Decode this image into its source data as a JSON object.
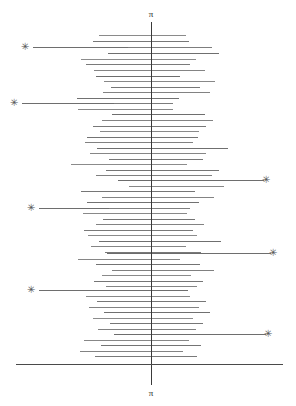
{
  "figure": {
    "width": 296,
    "height": 406,
    "background": "#ffffff"
  },
  "axes": {
    "vertical": {
      "name": "pi-axis",
      "x": 151,
      "y_top": 22,
      "y_bottom": 385,
      "color": "#3a3a3a",
      "top_label": "π",
      "bottom_label": "π"
    },
    "horizontal": {
      "name": "baseline",
      "y": 364,
      "x_start": 16,
      "x_end": 283,
      "color": "#4a4a4a"
    }
  },
  "style": {
    "bar_color": "#808080",
    "lead_line_color": "#6e6e6e",
    "marker_color": "#555555",
    "marker_glyph": "✳"
  },
  "chart_data": {
    "type": "bar",
    "title": "",
    "subtitle": "",
    "xlabel": "",
    "ylabel": "",
    "orientation": "horizontal",
    "center_x": 151,
    "axis_tick_labels": [
      "π",
      "π"
    ],
    "grid": false,
    "legend": null,
    "xlim": [
      0,
      296
    ],
    "ylim": [
      22,
      385
    ],
    "categories": [
      "r1",
      "r2",
      "r3",
      "r4",
      "r5",
      "r6",
      "r7",
      "r8",
      "r9",
      "r10",
      "r11",
      "r12",
      "r13",
      "r14",
      "r15",
      "r16",
      "r17",
      "r18",
      "r19",
      "r20",
      "r21",
      "r22",
      "r23",
      "r24",
      "r25",
      "r26",
      "r27",
      "r28",
      "r29",
      "r30",
      "r31",
      "r32",
      "r33",
      "r34",
      "r35",
      "r36",
      "r37",
      "r38",
      "r39",
      "r40",
      "r41",
      "r42",
      "r43",
      "r44",
      "r45",
      "r46",
      "r47",
      "r48",
      "r49",
      "r50",
      "r51",
      "r52",
      "r53",
      "r54",
      "r55",
      "r56",
      "r57",
      "r58",
      "r59",
      "r60",
      "r61",
      "r62",
      "r63",
      "r64",
      "r65",
      "r66",
      "r67",
      "r68",
      "r69",
      "r70",
      "r71",
      "r72",
      "r73",
      "r74",
      "r75",
      "r76",
      "r77",
      "r78",
      "r79",
      "r80",
      "r81",
      "r82",
      "r83",
      "r84",
      "r85",
      "r86"
    ],
    "bars": [
      {
        "y": 35,
        "x0": 99,
        "x1": 186,
        "shade": "#8a8a8a",
        "marked": false
      },
      {
        "y": 41,
        "x0": 93,
        "x1": 189,
        "shade": "#777777",
        "marked": false
      },
      {
        "y": 47,
        "x0": 128,
        "x1": 212,
        "shade": "#7d7d7d",
        "marked": true,
        "marker_side": "left",
        "marker_x": 25,
        "lead_x0": 33,
        "lead_x1": 128
      },
      {
        "y": 53,
        "x0": 108,
        "x1": 219,
        "shade": "#6f6f6f",
        "marked": false
      },
      {
        "y": 59,
        "x0": 81,
        "x1": 196,
        "shade": "#8c8c8c",
        "marked": false
      },
      {
        "y": 64,
        "x0": 86,
        "x1": 190,
        "shade": "#7a7a7a",
        "marked": false
      },
      {
        "y": 70,
        "x0": 94,
        "x1": 205,
        "shade": "#848484",
        "marked": false
      },
      {
        "y": 76,
        "x0": 96,
        "x1": 180,
        "shade": "#6d6d6d",
        "marked": false
      },
      {
        "y": 81,
        "x0": 104,
        "x1": 215,
        "shade": "#888888",
        "marked": false
      },
      {
        "y": 87,
        "x0": 111,
        "x1": 200,
        "shade": "#767676",
        "marked": false
      },
      {
        "y": 92,
        "x0": 103,
        "x1": 210,
        "shade": "#828282",
        "marked": false
      },
      {
        "y": 98,
        "x0": 77,
        "x1": 179,
        "shade": "#717171",
        "marked": false
      },
      {
        "y": 103,
        "x0": 114,
        "x1": 173,
        "shade": "#7c7c7c",
        "marked": true,
        "marker_side": "left",
        "marker_x": 14,
        "lead_x0": 22,
        "lead_x1": 114
      },
      {
        "y": 109,
        "x0": 78,
        "x1": 173,
        "shade": "#888888",
        "marked": false
      },
      {
        "y": 114,
        "x0": 112,
        "x1": 205,
        "shade": "#6e6e6e",
        "marked": false
      },
      {
        "y": 120,
        "x0": 102,
        "x1": 213,
        "shade": "#838383",
        "marked": false
      },
      {
        "y": 126,
        "x0": 93,
        "x1": 206,
        "shade": "#787878",
        "marked": false
      },
      {
        "y": 131,
        "x0": 100,
        "x1": 199,
        "shade": "#8a8a8a",
        "marked": false
      },
      {
        "y": 137,
        "x0": 87,
        "x1": 198,
        "shade": "#737373",
        "marked": false
      },
      {
        "y": 142,
        "x0": 85,
        "x1": 193,
        "shade": "#818181",
        "marked": false
      },
      {
        "y": 148,
        "x0": 97,
        "x1": 228,
        "shade": "#6f6f6f",
        "marked": false
      },
      {
        "y": 153,
        "x0": 90,
        "x1": 206,
        "shade": "#868686",
        "marked": false
      },
      {
        "y": 159,
        "x0": 109,
        "x1": 203,
        "shade": "#777777",
        "marked": false
      },
      {
        "y": 164,
        "x0": 71,
        "x1": 187,
        "shade": "#8b8b8b",
        "marked": false
      },
      {
        "y": 170,
        "x0": 106,
        "x1": 219,
        "shade": "#757575",
        "marked": false
      },
      {
        "y": 175,
        "x0": 96,
        "x1": 212,
        "shade": "#808080",
        "marked": false
      },
      {
        "y": 180,
        "x0": 118,
        "x1": 224,
        "shade": "#6c6c6c",
        "marked": true,
        "marker_side": "right",
        "marker_x": 266,
        "lead_x0": 224,
        "lead_x1": 264
      },
      {
        "y": 186,
        "x0": 129,
        "x1": 224,
        "shade": "#878787",
        "marked": false
      },
      {
        "y": 191,
        "x0": 81,
        "x1": 195,
        "shade": "#767676",
        "marked": false
      },
      {
        "y": 197,
        "x0": 102,
        "x1": 214,
        "shade": "#838383",
        "marked": false
      },
      {
        "y": 202,
        "x0": 87,
        "x1": 199,
        "shade": "#717171",
        "marked": false
      },
      {
        "y": 208,
        "x0": 109,
        "x1": 190,
        "shade": "#7e7e7e",
        "marked": true,
        "marker_side": "left",
        "marker_x": 31,
        "lead_x0": 39,
        "lead_x1": 109
      },
      {
        "y": 213,
        "x0": 83,
        "x1": 187,
        "shade": "#898989",
        "marked": false
      },
      {
        "y": 219,
        "x0": 103,
        "x1": 195,
        "shade": "#747474",
        "marked": false
      },
      {
        "y": 224,
        "x0": 96,
        "x1": 204,
        "shade": "#828282",
        "marked": false
      },
      {
        "y": 230,
        "x0": 84,
        "x1": 193,
        "shade": "#797979",
        "marked": false
      },
      {
        "y": 235,
        "x0": 88,
        "x1": 197,
        "shade": "#8b8b8b",
        "marked": false
      },
      {
        "y": 241,
        "x0": 99,
        "x1": 221,
        "shade": "#6f6f6f",
        "marked": false
      },
      {
        "y": 246,
        "x0": 91,
        "x1": 186,
        "shade": "#858585",
        "marked": false
      },
      {
        "y": 252,
        "x0": 105,
        "x1": 201,
        "shade": "#787878",
        "marked": false
      },
      {
        "y": 253,
        "x0": 107,
        "x1": 205,
        "shade": "#6c6c6c",
        "marked": true,
        "marker_side": "right",
        "marker_x": 273,
        "lead_x0": 205,
        "lead_x1": 271
      },
      {
        "y": 259,
        "x0": 78,
        "x1": 180,
        "shade": "#868686",
        "marked": false
      },
      {
        "y": 264,
        "x0": 96,
        "x1": 200,
        "shade": "#737373",
        "marked": false
      },
      {
        "y": 270,
        "x0": 112,
        "x1": 214,
        "shade": "#808080",
        "marked": false
      },
      {
        "y": 275,
        "x0": 102,
        "x1": 191,
        "shade": "#8a8a8a",
        "marked": false
      },
      {
        "y": 281,
        "x0": 94,
        "x1": 203,
        "shade": "#757575",
        "marked": false
      },
      {
        "y": 286,
        "x0": 106,
        "x1": 197,
        "shade": "#848484",
        "marked": false
      },
      {
        "y": 290,
        "x0": 108,
        "x1": 188,
        "shade": "#6e6e6e",
        "marked": true,
        "marker_side": "left",
        "marker_x": 31,
        "lead_x0": 39,
        "lead_x1": 108
      },
      {
        "y": 296,
        "x0": 86,
        "x1": 190,
        "shade": "#888888",
        "marked": false
      },
      {
        "y": 301,
        "x0": 97,
        "x1": 206,
        "shade": "#777777",
        "marked": false
      },
      {
        "y": 307,
        "x0": 89,
        "x1": 199,
        "shade": "#828282",
        "marked": false
      },
      {
        "y": 312,
        "x0": 104,
        "x1": 210,
        "shade": "#707070",
        "marked": false
      },
      {
        "y": 318,
        "x0": 93,
        "x1": 193,
        "shade": "#8c8c8c",
        "marked": false
      },
      {
        "y": 323,
        "x0": 110,
        "x1": 203,
        "shade": "#767676",
        "marked": false
      },
      {
        "y": 329,
        "x0": 98,
        "x1": 196,
        "shade": "#818181",
        "marked": false
      },
      {
        "y": 334,
        "x0": 114,
        "x1": 211,
        "shade": "#6d6d6d",
        "marked": true,
        "marker_side": "right",
        "marker_x": 268,
        "lead_x0": 211,
        "lead_x1": 266
      },
      {
        "y": 340,
        "x0": 84,
        "x1": 189,
        "shade": "#878787",
        "marked": false
      },
      {
        "y": 345,
        "x0": 101,
        "x1": 201,
        "shade": "#747474",
        "marked": false
      },
      {
        "y": 351,
        "x0": 80,
        "x1": 183,
        "shade": "#838383",
        "marked": false
      },
      {
        "y": 356,
        "x0": 95,
        "x1": 197,
        "shade": "#797979",
        "marked": false
      }
    ],
    "marked_rows": [
      {
        "index": 2,
        "side": "left"
      },
      {
        "index": 12,
        "side": "left"
      },
      {
        "index": 26,
        "side": "right"
      },
      {
        "index": 31,
        "side": "left"
      },
      {
        "index": 40,
        "side": "right"
      },
      {
        "index": 47,
        "side": "left"
      },
      {
        "index": 55,
        "side": "right"
      }
    ]
  }
}
